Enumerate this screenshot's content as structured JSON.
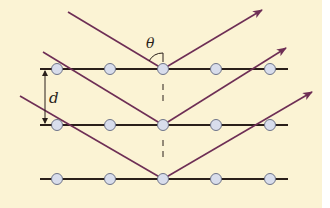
{
  "diagram": {
    "background": "#FBF3D4",
    "colors": {
      "ray": "#6E2E55",
      "lattice_line": "#2A1F1A",
      "atom_fill": "#D8DDEC",
      "atom_stroke": "#6E7388",
      "label": "#2A1F1A"
    },
    "labels": {
      "angle": "θ",
      "spacing": "d"
    },
    "planes": [
      {
        "y": 69,
        "atoms_x": [
          57,
          110,
          163,
          216,
          270
        ]
      },
      {
        "y": 125,
        "atoms_x": [
          57,
          110,
          163,
          216,
          270
        ]
      },
      {
        "y": 179,
        "atoms_x": [
          57,
          110,
          163,
          216,
          270
        ]
      }
    ],
    "rays": [
      {
        "incident_from": [
          68,
          12
        ],
        "hit": [
          163,
          69
        ],
        "reflected_to": [
          262,
          10
        ]
      },
      {
        "incident_from": [
          43,
          52
        ],
        "hit": [
          163,
          125
        ],
        "reflected_to": [
          286,
          48
        ]
      },
      {
        "incident_from": [
          20,
          96
        ],
        "hit": [
          163,
          179
        ],
        "reflected_to": [
          312,
          92
        ]
      }
    ]
  }
}
